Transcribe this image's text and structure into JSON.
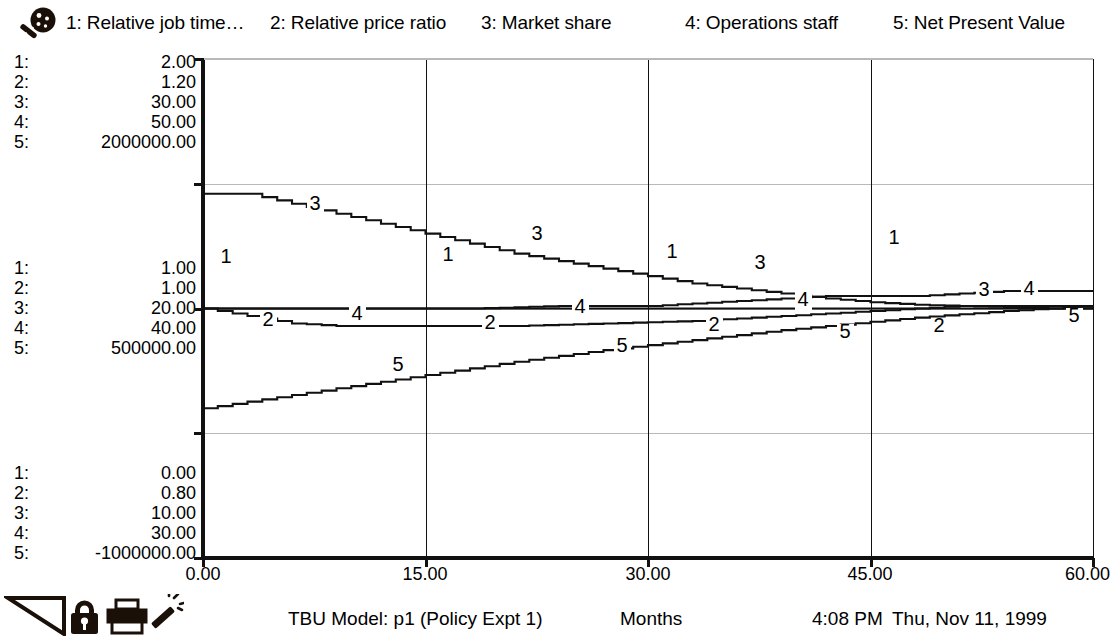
{
  "legend": {
    "icon": "magnifier-icon",
    "entries": [
      {
        "index": "1",
        "label": "1: Relative job time…"
      },
      {
        "index": "2",
        "label": "2: Relative price ratio"
      },
      {
        "index": "3",
        "label": "3: Market share"
      },
      {
        "index": "4",
        "label": "4: Operations staff"
      },
      {
        "index": "5",
        "label": "5: Net Present Value"
      }
    ]
  },
  "axes": {
    "y_scales": {
      "top": [
        {
          "idx": "1:",
          "value": "2.00"
        },
        {
          "idx": "2:",
          "value": "1.20"
        },
        {
          "idx": "3:",
          "value": "30.00"
        },
        {
          "idx": "4:",
          "value": "50.00"
        },
        {
          "idx": "5:",
          "value": "2000000.00"
        }
      ],
      "mid": [
        {
          "idx": "1:",
          "value": "1.00"
        },
        {
          "idx": "2:",
          "value": "1.00"
        },
        {
          "idx": "3:",
          "value": "20.00"
        },
        {
          "idx": "4:",
          "value": "40.00"
        },
        {
          "idx": "5:",
          "value": "500000.00"
        }
      ],
      "bottom": [
        {
          "idx": "1:",
          "value": "0.00"
        },
        {
          "idx": "2:",
          "value": "0.80"
        },
        {
          "idx": "3:",
          "value": "10.00"
        },
        {
          "idx": "4:",
          "value": "30.00"
        },
        {
          "idx": "5:",
          "value": "-1000000.00"
        }
      ]
    },
    "x_ticks": [
      "0.00",
      "15.00",
      "30.00",
      "45.00",
      "60.00"
    ]
  },
  "footer": {
    "model": "TBU Model: p1 (Policy Expt 1)",
    "xlabel": "Months",
    "time": "4:08 PM",
    "date": "Thu, Nov 11, 1999",
    "tools": [
      {
        "name": "triangle-tool-icon"
      },
      {
        "name": "lock-icon"
      },
      {
        "name": "printer-icon"
      },
      {
        "name": "magic-wand-icon"
      }
    ]
  },
  "chart_data": {
    "type": "line",
    "title": "TBU Model: p1 (Policy Expt 1)",
    "xlabel": "Months",
    "ylabel": "",
    "xlim": [
      0,
      60
    ],
    "xticks": [
      0,
      15,
      30,
      45,
      60
    ],
    "grid": true,
    "grid_y_fractions": [
      0.0,
      0.25,
      0.5,
      0.75,
      1.0
    ],
    "legend_position": "top",
    "line_color": "#111111",
    "series": [
      {
        "name": "Relative job time…",
        "marker_label": "1",
        "axis_range": [
          0.0,
          2.0
        ],
        "x": [
          0,
          3,
          6,
          9,
          12,
          15,
          18,
          21,
          24,
          27,
          30,
          33,
          36,
          39,
          42,
          45,
          48,
          51,
          54,
          57,
          60
        ],
        "values": [
          1.0,
          1.0,
          1.0,
          1.0,
          1.0,
          1.0,
          1.0,
          1.005,
          1.01,
          1.01,
          1.01,
          1.02,
          1.03,
          1.04,
          1.05,
          1.05,
          1.05,
          1.06,
          1.07,
          1.07,
          1.07
        ]
      },
      {
        "name": "Relative price ratio",
        "marker_label": "2",
        "axis_range": [
          0.8,
          1.2
        ],
        "x": [
          0,
          3,
          6,
          9,
          12,
          15,
          18,
          21,
          24,
          27,
          30,
          33,
          36,
          39,
          42,
          45,
          48,
          51,
          54,
          57,
          60
        ],
        "values": [
          1.0,
          1.0,
          1.0,
          1.0,
          1.0,
          1.0,
          1.0,
          1.0,
          1.0,
          1.0,
          1.0,
          1.0,
          1.0,
          1.0,
          1.0,
          1.0,
          1.0,
          1.0,
          1.0,
          1.0,
          1.0
        ]
      },
      {
        "name": "Market share",
        "marker_label": "3",
        "axis_range": [
          10.0,
          30.0
        ],
        "x": [
          0,
          3,
          6,
          9,
          12,
          15,
          18,
          21,
          24,
          27,
          30,
          33,
          36,
          39,
          42,
          45,
          48,
          51,
          54,
          57,
          60
        ],
        "values": [
          24.6,
          24.6,
          24.2,
          23.8,
          23.4,
          23.0,
          22.6,
          22.2,
          21.9,
          21.6,
          21.3,
          21.0,
          20.8,
          20.6,
          20.4,
          20.25,
          20.15,
          20.1,
          20.05,
          20.0,
          20.0
        ]
      },
      {
        "name": "Operations staff",
        "marker_label": "4",
        "axis_range": [
          30.0,
          50.0
        ],
        "x": [
          0,
          3,
          6,
          9,
          12,
          15,
          18,
          21,
          24,
          27,
          30,
          33,
          36,
          39,
          42,
          45,
          48,
          51,
          54,
          57,
          60
        ],
        "values": [
          40.0,
          39.7,
          39.4,
          39.3,
          39.3,
          39.3,
          39.3,
          39.3,
          39.35,
          39.4,
          39.45,
          39.5,
          39.6,
          39.7,
          39.8,
          39.9,
          40.0,
          40.1,
          40.1,
          40.1,
          40.1
        ]
      },
      {
        "name": "Net Present Value",
        "marker_label": "5",
        "axis_range": [
          -1000000.0,
          2000000.0
        ],
        "x": [
          0,
          3,
          6,
          9,
          12,
          15,
          18,
          21,
          24,
          27,
          30,
          33,
          36,
          39,
          42,
          45,
          48,
          51,
          54,
          57,
          60
        ],
        "values": [
          -100000,
          -60000,
          -20000,
          20000,
          60000,
          100000,
          140000,
          180000,
          215000,
          250000,
          280000,
          310000,
          340000,
          370000,
          395000,
          420000,
          445000,
          465000,
          485000,
          500000,
          515000
        ]
      }
    ],
    "markers": [
      {
        "series": "3",
        "x_px": 315,
        "y_px": 209
      },
      {
        "series": "3",
        "x_px": 537,
        "y_px": 239
      },
      {
        "series": "3",
        "x_px": 760,
        "y_px": 268
      },
      {
        "series": "3",
        "x_px": 984,
        "y_px": 295
      },
      {
        "series": "1",
        "x_px": 226,
        "y_px": 262
      },
      {
        "series": "1",
        "x_px": 448,
        "y_px": 260
      },
      {
        "series": "1",
        "x_px": 672,
        "y_px": 257
      },
      {
        "series": "1",
        "x_px": 894,
        "y_px": 243
      },
      {
        "series": "4",
        "x_px": 357,
        "y_px": 319
      },
      {
        "series": "4",
        "x_px": 580,
        "y_px": 312
      },
      {
        "series": "4",
        "x_px": 803,
        "y_px": 305
      },
      {
        "series": "4",
        "x_px": 1029,
        "y_px": 294
      },
      {
        "series": "2",
        "x_px": 268,
        "y_px": 325
      },
      {
        "series": "2",
        "x_px": 490,
        "y_px": 328
      },
      {
        "series": "2",
        "x_px": 714,
        "y_px": 330
      },
      {
        "series": "2",
        "x_px": 939,
        "y_px": 331
      },
      {
        "series": "5",
        "x_px": 398,
        "y_px": 370
      },
      {
        "series": "5",
        "x_px": 622,
        "y_px": 351
      },
      {
        "series": "5",
        "x_px": 845,
        "y_px": 337
      },
      {
        "series": "5",
        "x_px": 1074,
        "y_px": 321
      }
    ]
  }
}
